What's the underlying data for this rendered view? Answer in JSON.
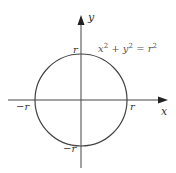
{
  "diagram": {
    "equation": {
      "base": "x",
      "parts": [
        "x",
        "2",
        " + ",
        "y",
        "2",
        " = ",
        "r",
        "2"
      ]
    },
    "axes": {
      "x_label": "x",
      "y_label": "y"
    },
    "intercepts": {
      "top": "r",
      "right": "r",
      "left": "−r",
      "bottom": "−r"
    },
    "colors": {
      "axis": "#444444",
      "circle": "#444444",
      "text": "#333333"
    }
  }
}
